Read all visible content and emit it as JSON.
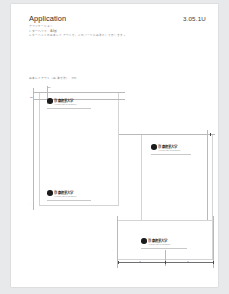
{
  "viewer": {
    "background_color": "#e8e9ea",
    "page_color": "#ffffff"
  },
  "header": {
    "title": "Application",
    "folio": "3.05.1U",
    "subtitle_lines": [
      "アプリケーション",
      "レターヘッド／A4版",
      "レターヘッドの基本レイアウトを、このページに基準として示します。"
    ]
  },
  "caption": {
    "text": "基本レイアウト（基準寸法）",
    "note": "mm"
  },
  "brand": {
    "logo_kana": "がくえん",
    "logo_name": "京都産業大学",
    "logo_en": "KYOTO SANGYO UNIVERSITY",
    "mark_color": "#1b1b1b",
    "rule_color": "#c9c9c9"
  },
  "panels": [
    {
      "id": "panel-a",
      "name": "レターヘッド A4 たて",
      "orientation": "portrait",
      "logo_position": "top-left",
      "second_logo_position": "bottom-left"
    },
    {
      "id": "panel-b",
      "name": "レターヘッド 第2面",
      "orientation": "portrait",
      "logo_position": "top-left"
    },
    {
      "id": "panel-c",
      "name": "封筒・カード",
      "orientation": "landscape",
      "logo_position": "left"
    }
  ],
  "dimensions": {
    "vertical_top": "20",
    "vertical_left": "15",
    "horizontal_a": "a",
    "horizontal_b": "b",
    "unit": "mm"
  },
  "guides": {
    "guide_color": "#b9b9b9",
    "dimension_color": "#6f6f6f",
    "tick_color": "#4a4a4a"
  }
}
